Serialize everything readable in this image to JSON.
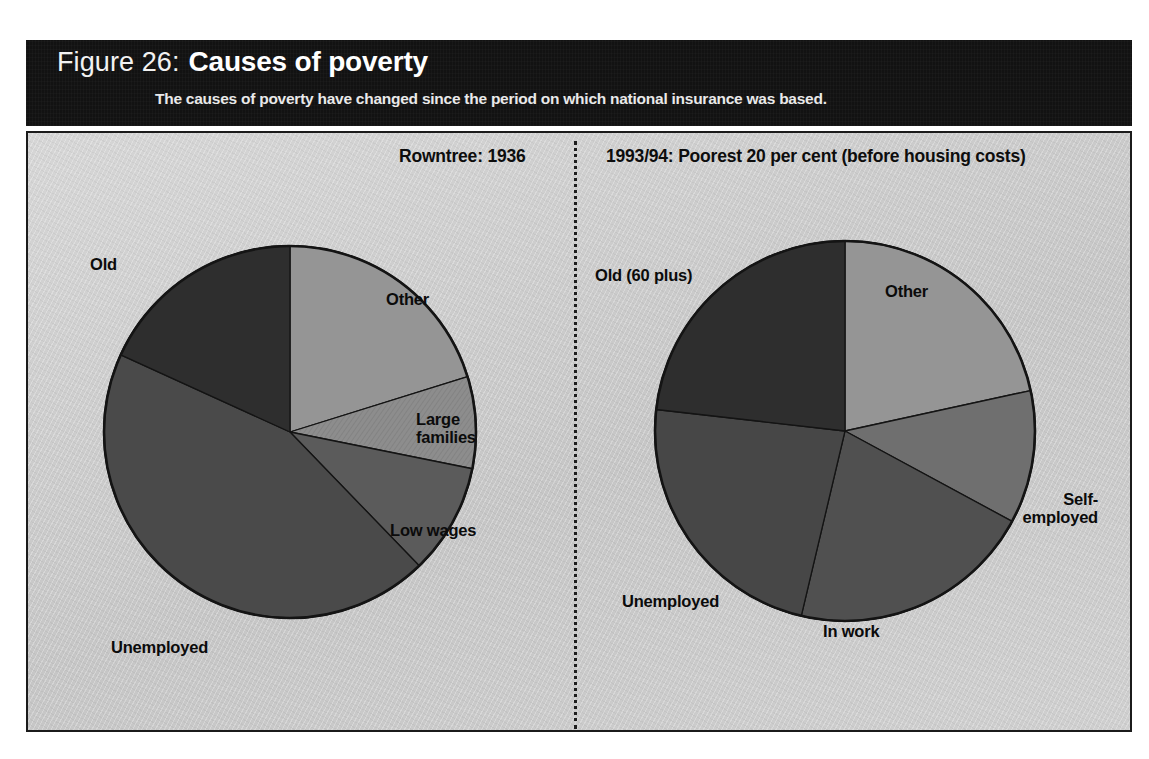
{
  "header": {
    "figure_number": "Figure 26:",
    "title": "Causes of poverty",
    "subtitle": "The causes of poverty have changed since the period on which national insurance was based."
  },
  "panels": {
    "left_title": "Rowntree: 1936",
    "right_title": "1993/94: Poorest 20 per cent (before housing costs)"
  },
  "labels": {
    "left": {
      "old": "Old",
      "other": "Other",
      "large_families": "Large\nfamilies",
      "low_wages": "Low wages",
      "unemployed": "Unemployed"
    },
    "right": {
      "old": "Old (60 plus)",
      "other": "Other",
      "self_employed": "Self-\nemployed",
      "in_work": "In work",
      "unemployed": "Unemployed"
    }
  },
  "colors": {
    "header_background": "#121212",
    "header_text": "#ffffff",
    "panel_background": "#c9c9c9",
    "panel_border": "#1b1b1b",
    "slice_outline": "#141414",
    "old": "#2e2e2e",
    "other": "#959595",
    "large_families": "#8d8d8d",
    "low_wages": "#5b5b5b",
    "unemployed_left": "#4a4a4a",
    "self_employed": "#6f6f6f",
    "in_work": "#505050",
    "unemployed_right": "#474747"
  },
  "chart_data": [
    {
      "type": "pie",
      "title": "Rowntree: 1936",
      "id": "left-pie",
      "unit": "per cent",
      "grid": false,
      "legend": "none",
      "label_placement": "outside",
      "start_angle_deg": 0,
      "direction": "clockwise",
      "categories": [
        "Other",
        "Large families",
        "Low wages",
        "Unemployed",
        "Old"
      ],
      "values": [
        20.2,
        8.0,
        9.6,
        44.0,
        18.2
      ],
      "slices": [
        {
          "label": "Other",
          "value": 20.2,
          "start_deg": 0.0,
          "end_deg": 72.7,
          "color": "#959595"
        },
        {
          "label": "Large families",
          "value": 8.0,
          "start_deg": 72.7,
          "end_deg": 101.4,
          "color": "#8d8d8d"
        },
        {
          "label": "Low wages",
          "value": 9.6,
          "start_deg": 101.4,
          "end_deg": 136.0,
          "color": "#5b5b5b"
        },
        {
          "label": "Unemployed",
          "value": 44.0,
          "start_deg": 136.0,
          "end_deg": 294.5,
          "color": "#4a4a4a"
        },
        {
          "label": "Old",
          "value": 18.2,
          "start_deg": 294.5,
          "end_deg": 360.0,
          "color": "#2e2e2e"
        }
      ]
    },
    {
      "type": "pie",
      "title": "1993/94: Poorest 20 per cent (before housing costs)",
      "id": "right-pie",
      "unit": "per cent",
      "grid": false,
      "legend": "none",
      "label_placement": "outside",
      "start_angle_deg": 0,
      "direction": "clockwise",
      "categories": [
        "Other",
        "Self-employed",
        "In work",
        "Unemployed",
        "Old (60 plus)"
      ],
      "values": [
        21.6,
        11.3,
        20.8,
        23.1,
        23.2
      ],
      "slices": [
        {
          "label": "Other",
          "value": 21.6,
          "start_deg": 0.0,
          "end_deg": 77.7,
          "color": "#959595"
        },
        {
          "label": "Self-employed",
          "value": 11.3,
          "start_deg": 77.7,
          "end_deg": 118.4,
          "color": "#6f6f6f"
        },
        {
          "label": "In work",
          "value": 20.8,
          "start_deg": 118.4,
          "end_deg": 193.3,
          "color": "#505050"
        },
        {
          "label": "Unemployed",
          "value": 23.1,
          "start_deg": 193.3,
          "end_deg": 276.5,
          "color": "#474747"
        },
        {
          "label": "Old (60 plus)",
          "value": 23.2,
          "start_deg": 276.5,
          "end_deg": 360.0,
          "color": "#2e2e2e"
        }
      ]
    }
  ]
}
